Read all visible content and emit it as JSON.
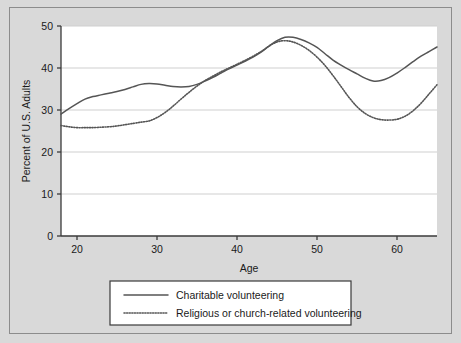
{
  "figure": {
    "background_color": "#d9d9d9",
    "panel_color": "#ffffff",
    "frame_color": "#8c8c8c"
  },
  "chart_data": {
    "type": "line",
    "title": "",
    "xlabel": "Age",
    "ylabel": "Percent of U.S. Adults",
    "xlim": [
      18,
      65
    ],
    "ylim": [
      0,
      50
    ],
    "xticks": [
      20,
      30,
      40,
      50,
      60
    ],
    "yticks": [
      0,
      10,
      20,
      30,
      40,
      50
    ],
    "xtick_labels": [
      "20",
      "30",
      "40",
      "50",
      "60"
    ],
    "ytick_labels": [
      "0",
      "10",
      "20",
      "30",
      "40",
      "50"
    ],
    "grid": "horizontal",
    "legend_position": "below-axes",
    "series": [
      {
        "name": "Charitable volunteering",
        "style": "solid",
        "color": "#555555",
        "x": [
          18,
          19,
          20,
          21,
          22,
          23,
          24,
          25,
          26,
          27,
          28,
          29,
          30,
          31,
          32,
          33,
          34,
          35,
          36,
          37,
          38,
          39,
          40,
          41,
          42,
          43,
          44,
          45,
          46,
          47,
          48,
          49,
          50,
          51,
          52,
          53,
          54,
          55,
          56,
          57,
          58,
          59,
          60,
          61,
          62,
          63,
          64,
          65
        ],
        "values": [
          29.0,
          30.3,
          31.5,
          32.6,
          33.2,
          33.6,
          34.0,
          34.4,
          34.9,
          35.5,
          36.1,
          36.3,
          36.2,
          35.9,
          35.6,
          35.5,
          35.6,
          36.1,
          36.9,
          37.8,
          38.8,
          39.8,
          40.7,
          41.6,
          42.6,
          43.8,
          45.2,
          46.5,
          47.3,
          47.3,
          46.8,
          46.0,
          44.9,
          43.4,
          41.9,
          40.7,
          39.6,
          38.6,
          37.6,
          36.9,
          37.0,
          37.7,
          38.8,
          40.1,
          41.5,
          42.8,
          43.9,
          45.0
        ]
      },
      {
        "name": "Religious or church-related volunteering",
        "style": "dotted",
        "color": "#555555",
        "x": [
          18,
          19,
          20,
          21,
          22,
          23,
          24,
          25,
          26,
          27,
          28,
          29,
          30,
          31,
          32,
          33,
          34,
          35,
          36,
          37,
          38,
          39,
          40,
          41,
          42,
          43,
          44,
          45,
          46,
          47,
          48,
          49,
          50,
          51,
          52,
          53,
          54,
          55,
          56,
          57,
          58,
          59,
          60,
          61,
          62,
          63,
          64,
          65
        ],
        "values": [
          26.3,
          26.0,
          25.8,
          25.8,
          25.8,
          25.9,
          26.0,
          26.2,
          26.5,
          26.8,
          27.1,
          27.4,
          28.2,
          29.4,
          30.9,
          32.6,
          34.2,
          35.7,
          37.0,
          38.1,
          39.1,
          40.0,
          40.9,
          41.8,
          42.8,
          43.9,
          45.2,
          46.2,
          46.5,
          46.2,
          45.4,
          44.2,
          42.6,
          40.6,
          38.2,
          35.6,
          33.0,
          30.8,
          29.2,
          28.2,
          27.7,
          27.6,
          27.8,
          28.5,
          29.8,
          31.6,
          33.8,
          36.0
        ]
      }
    ]
  },
  "legend": {
    "items": [
      {
        "label": "Charitable volunteering",
        "style": "solid"
      },
      {
        "label": "Religious or church-related volunteering",
        "style": "dotted"
      }
    ]
  }
}
